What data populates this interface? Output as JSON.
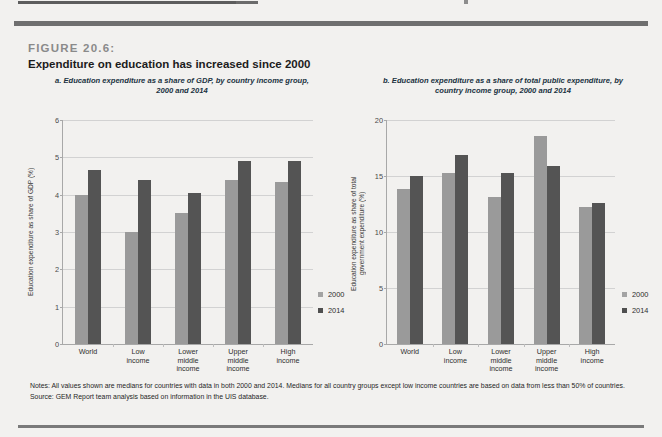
{
  "figure": {
    "number": "FIGURE 20.6:",
    "title": "Expenditure on education has increased since 2000"
  },
  "notes": {
    "notes_text": "Notes: All values shown are medians for countries with data in both 2000 and 2014. Medians for all country groups except low income countries are based on data from less than 50% of countries.",
    "source_text": "Source: GEM Report team analysis based on information in the UIS database."
  },
  "legend": {
    "items": [
      {
        "label": "2000",
        "color": "#9a9a9a"
      },
      {
        "label": "2014",
        "color": "#545454"
      }
    ]
  },
  "colors": {
    "series_2000": "#9a9a9a",
    "series_2014": "#545454",
    "background": "#f2f1ef",
    "rule": "#6f6f6f",
    "panel_title": "#20323f"
  },
  "chart_data": [
    {
      "type": "bar",
      "panel": "a",
      "title": "a. Education expenditure as a share of GDP, by country income group, 2000 and 2014",
      "categories": [
        "World",
        "Low\nincome",
        "Lower\nmiddle\nincome",
        "Upper\nmiddle\nincome",
        "High\nincome"
      ],
      "series": [
        {
          "name": "2000",
          "values": [
            4.0,
            3.0,
            3.5,
            4.4,
            4.35
          ]
        },
        {
          "name": "2014",
          "values": [
            4.65,
            4.4,
            4.05,
            4.9,
            4.9
          ]
        }
      ],
      "xlabel": "",
      "ylabel": "Education expenditure as share of GDP (%)",
      "ylim": [
        0,
        6
      ],
      "yticks": [
        0,
        1,
        2,
        3,
        4,
        5,
        6
      ],
      "grid": true,
      "legend_position": "right"
    },
    {
      "type": "bar",
      "panel": "b",
      "title": "b. Education expenditure as a share of total public expenditure, by country income group, 2000 and 2014",
      "categories": [
        "World",
        "Low\nincome",
        "Lower\nmiddle\nincome",
        "Upper\nmiddle\nincome",
        "High\nincome"
      ],
      "series": [
        {
          "name": "2000",
          "values": [
            13.8,
            15.3,
            13.1,
            18.6,
            12.2
          ]
        },
        {
          "name": "2014",
          "values": [
            15.0,
            16.9,
            15.3,
            15.9,
            12.6
          ]
        }
      ],
      "xlabel": "",
      "ylabel": "Education expenditure as share of total\ngovernment expenditure (%)",
      "ylim": [
        0,
        20
      ],
      "yticks": [
        0,
        5,
        10,
        15,
        20
      ],
      "grid": true,
      "legend_position": "right"
    }
  ]
}
